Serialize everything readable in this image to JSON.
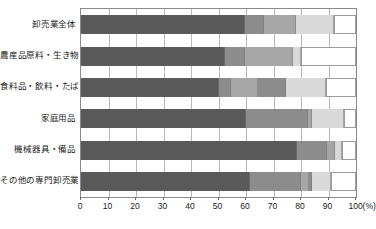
{
  "chart_data": {
    "type": "bar",
    "orientation": "horizontal",
    "stacked": true,
    "normalized": true,
    "title": "",
    "subtitle": "",
    "xlabel": "",
    "ylabel": "",
    "xlim": [
      0,
      100
    ],
    "x_unit": "(%)",
    "grid": true,
    "legend": "none",
    "xticks": [
      0,
      10,
      20,
      30,
      40,
      50,
      60,
      70,
      80,
      90,
      100
    ],
    "xtick_labels": [
      "0",
      "10",
      "20",
      "30",
      "40",
      "50",
      "60",
      "70",
      "80",
      "90",
      "100(%)"
    ],
    "categories": [
      "卸売業全体",
      "農産品原料・生き物",
      "食料品・飲料・たばこ",
      "家庭用品",
      "機械器具・備品",
      "その他の専門卸売業"
    ],
    "series": [
      {
        "name": "segment-1",
        "color": "#595959",
        "values": [
          59.5,
          52.5,
          50.0,
          60.0,
          78.5,
          61.5
        ]
      },
      {
        "name": "segment-2",
        "color": "#8c8c8c",
        "values": [
          7.0,
          7.0,
          4.5,
          22.5,
          11.0,
          18.5
        ]
      },
      {
        "name": "segment-3",
        "color": "#a6a6a6",
        "values": [
          11.5,
          17.5,
          10.0,
          1.5,
          3.0,
          3.0
        ]
      },
      {
        "name": "segment-4",
        "color": "#8c8c8c",
        "values": [
          0.0,
          0.0,
          10.0,
          0.0,
          0.0,
          1.0
        ]
      },
      {
        "name": "segment-5",
        "color": "#d9d9d9",
        "values": [
          14.0,
          3.0,
          14.5,
          11.5,
          2.5,
          7.0
        ]
      },
      {
        "name": "segment-6",
        "color": "#ffffff",
        "values": [
          8.0,
          20.0,
          11.0,
          4.5,
          5.0,
          9.0
        ]
      }
    ],
    "cumulative_boundaries": [
      [
        59.5,
        66.5,
        78.0,
        78.0,
        92.0,
        100.0
      ],
      [
        52.5,
        59.5,
        77.0,
        77.0,
        80.0,
        100.0
      ],
      [
        50.0,
        54.5,
        64.5,
        74.5,
        89.0,
        100.0
      ],
      [
        60.0,
        82.5,
        84.0,
        84.0,
        95.5,
        100.0
      ],
      [
        78.5,
        89.5,
        92.5,
        92.5,
        95.0,
        100.0
      ],
      [
        61.5,
        80.0,
        83.0,
        84.0,
        91.0,
        100.0
      ]
    ],
    "colors": {
      "seg1": "#595959",
      "seg2": "#8c8c8c",
      "seg3": "#a6a6a6",
      "seg4": "#8c8c8c",
      "seg5": "#d9d9d9",
      "seg6": "#ffffff",
      "grid": "#b8b8b8",
      "axis": "#8a8a8a",
      "text": "#1a1a1a",
      "background": "#ffffff"
    }
  }
}
